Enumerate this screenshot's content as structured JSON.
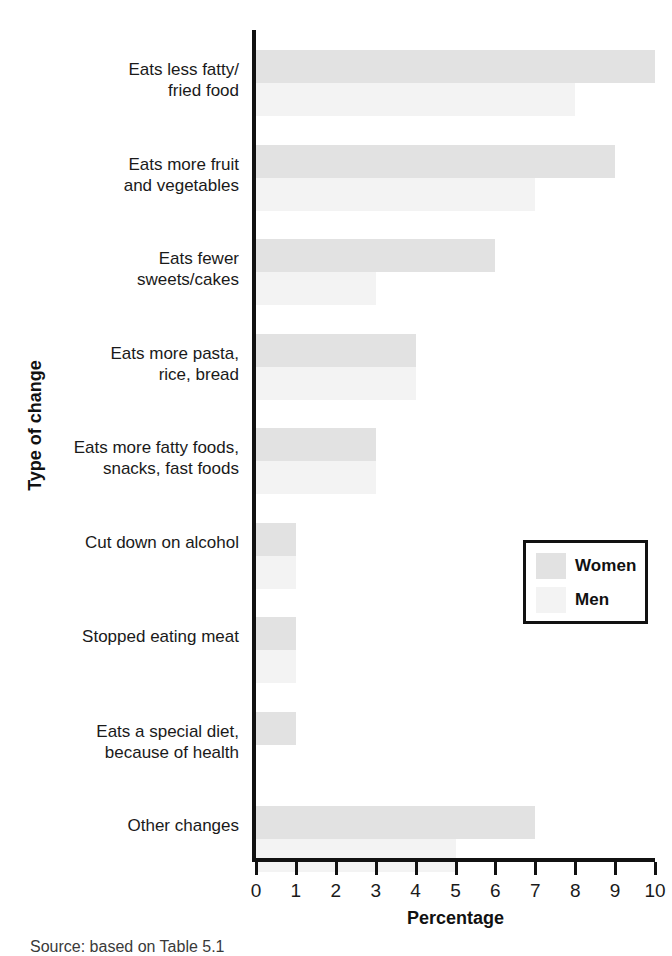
{
  "chart_data": {
    "type": "bar",
    "orientation": "horizontal",
    "title": "",
    "xlabel": "Percentage",
    "ylabel": "Type of change",
    "xlim": [
      0,
      10
    ],
    "xticks": [
      0,
      1,
      2,
      3,
      4,
      5,
      6,
      7,
      8,
      9,
      10
    ],
    "xtick_labels": [
      "0",
      "1",
      "2",
      "3",
      "4",
      "5",
      "6",
      "7",
      "8",
      "9",
      "10"
    ],
    "grid": false,
    "legend_position": "middle-right",
    "categories": [
      "Eats less fatty/\nfried food",
      "Eats more fruit\nand vegetables",
      "Eats fewer\nsweets/cakes",
      "Eats more pasta,\nrice, bread",
      "Eats more fatty foods,\nsnacks, fast foods",
      "Cut down on alcohol",
      "Stopped eating meat",
      "Eats a special diet,\nbecause of health",
      "Other changes"
    ],
    "series": [
      {
        "name": "Women",
        "color": "#e2e2e2",
        "values": [
          10,
          9,
          6,
          4,
          3,
          1,
          1,
          1,
          7
        ]
      },
      {
        "name": "Men",
        "color": "#f3f3f3",
        "values": [
          8,
          7,
          3,
          4,
          3,
          1,
          1,
          0,
          5
        ]
      }
    ]
  },
  "legend": {
    "items": [
      {
        "label": "Women",
        "color": "#e2e2e2"
      },
      {
        "label": "Men",
        "color": "#f3f3f3"
      }
    ]
  },
  "axes": {
    "x_title": "Percentage",
    "y_title": "Type of change"
  },
  "caption": {
    "text": "Source: based on Table 5.1"
  }
}
